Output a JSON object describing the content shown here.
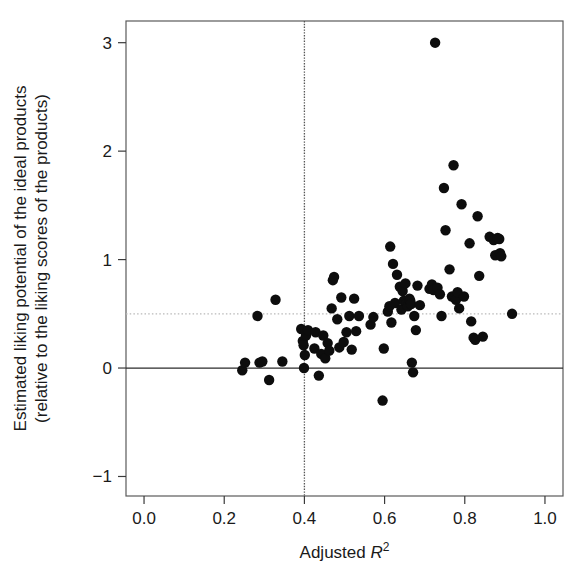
{
  "figure": {
    "background_color": "#ffffff",
    "point_color": "#0d0d0d",
    "frame_color": "#5a5a5a"
  },
  "chart_data": {
    "type": "scatter",
    "title": "",
    "subtitle": "",
    "xlabel": "Adjusted R2",
    "xlabel_base": "Adjusted ",
    "xlabel_symbol": "R",
    "xlabel_exponent": "2",
    "ylabel_line1": "Estimated liking potential of the ideal products",
    "ylabel_line2": "(relative to the liking scores of the products)",
    "xlim": [
      -0.045,
      1.045
    ],
    "ylim": [
      -1.18,
      3.2
    ],
    "xticks": [
      0.0,
      0.2,
      0.4,
      0.6,
      0.8,
      1.0
    ],
    "xticklabels": [
      "0.0",
      "0.2",
      "0.4",
      "0.6",
      "0.8",
      "1.0"
    ],
    "yticks": [
      -1,
      0,
      1,
      2,
      3
    ],
    "yticklabels": [
      "-1",
      "0",
      "1",
      "2",
      "3"
    ],
    "grid": false,
    "legend": null,
    "reference_lines": [
      {
        "name": "zero-horizontal",
        "orientation": "horizontal",
        "value": 0.0,
        "style": "solid",
        "color": "#2b2b2b"
      },
      {
        "name": "half-horizontal",
        "orientation": "horizontal",
        "value": 0.5,
        "style": "dotted",
        "color": "#b9b9b9"
      },
      {
        "name": "threshold-vertical",
        "orientation": "vertical",
        "value": 0.4,
        "style": "dotted",
        "color": "#555555"
      }
    ],
    "point_radius": 5.2,
    "n_points": 98,
    "points": [
      [
        0.245,
        -0.02
      ],
      [
        0.252,
        0.05
      ],
      [
        0.283,
        0.48
      ],
      [
        0.288,
        0.05
      ],
      [
        0.295,
        0.06
      ],
      [
        0.312,
        -0.11
      ],
      [
        0.328,
        0.63
      ],
      [
        0.345,
        0.06
      ],
      [
        0.392,
        0.36
      ],
      [
        0.396,
        0.25
      ],
      [
        0.398,
        0.21
      ],
      [
        0.399,
        0.0
      ],
      [
        0.401,
        0.12
      ],
      [
        0.404,
        0.3
      ],
      [
        0.409,
        0.35
      ],
      [
        0.425,
        0.18
      ],
      [
        0.428,
        0.33
      ],
      [
        0.436,
        -0.07
      ],
      [
        0.442,
        0.13
      ],
      [
        0.447,
        0.3
      ],
      [
        0.452,
        0.09
      ],
      [
        0.458,
        0.23
      ],
      [
        0.462,
        0.16
      ],
      [
        0.468,
        0.55
      ],
      [
        0.471,
        0.81
      ],
      [
        0.474,
        0.84
      ],
      [
        0.482,
        0.45
      ],
      [
        0.487,
        0.19
      ],
      [
        0.492,
        0.65
      ],
      [
        0.498,
        0.24
      ],
      [
        0.505,
        0.33
      ],
      [
        0.512,
        0.48
      ],
      [
        0.518,
        0.17
      ],
      [
        0.524,
        0.64
      ],
      [
        0.529,
        0.34
      ],
      [
        0.536,
        0.48
      ],
      [
        0.565,
        0.4
      ],
      [
        0.572,
        0.47
      ],
      [
        0.595,
        -0.3
      ],
      [
        0.598,
        0.18
      ],
      [
        0.608,
        0.52
      ],
      [
        0.612,
        0.57
      ],
      [
        0.614,
        1.12
      ],
      [
        0.617,
        0.42
      ],
      [
        0.621,
        0.96
      ],
      [
        0.626,
        0.6
      ],
      [
        0.631,
        0.86
      ],
      [
        0.638,
        0.75
      ],
      [
        0.642,
        0.54
      ],
      [
        0.645,
        0.71
      ],
      [
        0.648,
        0.62
      ],
      [
        0.652,
        0.78
      ],
      [
        0.655,
        0.6
      ],
      [
        0.658,
        0.57
      ],
      [
        0.662,
        0.64
      ],
      [
        0.664,
        0.62
      ],
      [
        0.666,
        0.59
      ],
      [
        0.668,
        0.05
      ],
      [
        0.671,
        -0.04
      ],
      [
        0.674,
        0.48
      ],
      [
        0.678,
        0.35
      ],
      [
        0.682,
        0.76
      ],
      [
        0.688,
        0.58
      ],
      [
        0.712,
        0.73
      ],
      [
        0.718,
        0.77
      ],
      [
        0.722,
        0.72
      ],
      [
        0.726,
        3.0
      ],
      [
        0.732,
        0.74
      ],
      [
        0.738,
        0.68
      ],
      [
        0.742,
        0.48
      ],
      [
        0.748,
        1.66
      ],
      [
        0.752,
        1.27
      ],
      [
        0.762,
        0.91
      ],
      [
        0.768,
        0.66
      ],
      [
        0.772,
        1.87
      ],
      [
        0.775,
        0.65
      ],
      [
        0.778,
        0.63
      ],
      [
        0.782,
        0.7
      ],
      [
        0.786,
        0.55
      ],
      [
        0.792,
        1.51
      ],
      [
        0.798,
        0.66
      ],
      [
        0.812,
        1.15
      ],
      [
        0.816,
        0.43
      ],
      [
        0.822,
        0.28
      ],
      [
        0.826,
        0.26
      ],
      [
        0.832,
        1.4
      ],
      [
        0.836,
        0.85
      ],
      [
        0.845,
        0.29
      ],
      [
        0.862,
        1.21
      ],
      [
        0.872,
        1.18
      ],
      [
        0.876,
        1.04
      ],
      [
        0.882,
        1.2
      ],
      [
        0.886,
        1.19
      ],
      [
        0.888,
        1.06
      ],
      [
        0.891,
        1.03
      ],
      [
        0.918,
        0.5
      ]
    ]
  }
}
